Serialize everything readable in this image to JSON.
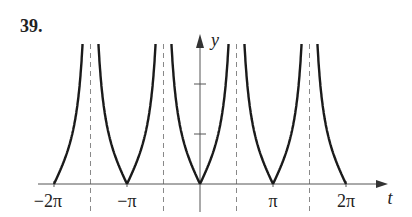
{
  "problem_number": "39.",
  "chart_data": {
    "type": "line",
    "function": "y = |tan t|",
    "title": "",
    "xlabel": "t",
    "ylabel": "y",
    "xlim": [
      -6.2832,
      6.2832
    ],
    "ylim": [
      0,
      2.9
    ],
    "x_tick_labels": [
      "-2π",
      "-π",
      "π",
      "2π"
    ],
    "x_tick_values": [
      -6.2832,
      -3.1416,
      3.1416,
      6.2832
    ],
    "y_ticks": [
      1,
      2
    ],
    "y_tick_labels_shown": [],
    "asymptotes": [
      -4.7124,
      -1.5708,
      1.5708,
      4.7124
    ],
    "zeros": [
      -6.2832,
      -3.1416,
      0,
      3.1416,
      6.2832
    ],
    "series": [
      {
        "name": "|tan t|",
        "x": [
          -6.2832,
          -5.4978,
          -4.9,
          -4.75,
          -3.1416,
          -2.3562,
          -1.7,
          -1.6,
          0,
          0.7854,
          1.4,
          1.53,
          3.1416,
          3.927,
          4.5,
          4.66,
          6.2832
        ],
        "values": [
          0,
          1,
          3.2,
          26,
          0,
          1,
          7.7,
          34,
          0,
          1,
          5.8,
          24,
          0,
          1,
          4.6,
          19,
          0
        ]
      }
    ],
    "grid": false,
    "legend": null
  },
  "colors": {
    "curve": "#1a1a1a",
    "axis": "#555555",
    "asymptote": "#888888"
  }
}
